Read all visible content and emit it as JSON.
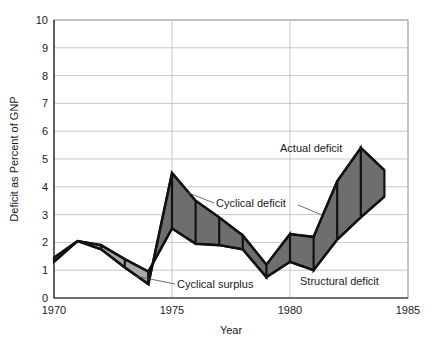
{
  "chart_data": {
    "type": "area",
    "title": "",
    "xlabel": "Year",
    "ylabel": "Deficit as Percent of GNP",
    "xlim": [
      1970,
      1985
    ],
    "ylim": [
      0,
      10
    ],
    "xticks": [
      "1970",
      "1975",
      "1980",
      "1985"
    ],
    "xtick_values": [
      1970,
      1975,
      1980,
      1985
    ],
    "yticks": [
      "0",
      "1",
      "2",
      "3",
      "4",
      "5",
      "6",
      "7",
      "8",
      "9",
      "10"
    ],
    "ytick_values": [
      0,
      1,
      2,
      3,
      4,
      5,
      6,
      7,
      8,
      9,
      10
    ],
    "grid": true,
    "legend_position": "inline-annotations",
    "x": [
      1970,
      1971,
      1972,
      1973,
      1974,
      1975,
      1976,
      1977,
      1978,
      1979,
      1980,
      1981,
      1982,
      1983,
      1984
    ],
    "series": [
      {
        "name": "Actual deficit",
        "values": [
          1.45,
          2.05,
          1.75,
          1.1,
          0.5,
          4.5,
          3.5,
          2.9,
          2.25,
          1.2,
          2.3,
          2.2,
          4.2,
          5.4,
          4.6
        ]
      },
      {
        "name": "Structural deficit",
        "values": [
          1.3,
          2.05,
          1.9,
          1.4,
          0.95,
          2.5,
          1.95,
          1.9,
          1.75,
          0.75,
          1.3,
          1.0,
          2.1,
          2.9,
          3.65
        ]
      }
    ],
    "annotations": [
      {
        "name": "actual-deficit",
        "text": "Actual deficit"
      },
      {
        "name": "cyclical-deficit",
        "text": "Cyclical deficit"
      },
      {
        "name": "cyclical-surplus",
        "text": "Cyclical surplus"
      },
      {
        "name": "structural-deficit",
        "text": "Structural deficit"
      }
    ],
    "colors": {
      "cyclical_deficit_fill": "#6e6e6e",
      "cyclical_surplus_fill": "#a8a8a8",
      "line": "#111111",
      "grid": "#b9b9b9",
      "background": "#ffffff"
    }
  }
}
